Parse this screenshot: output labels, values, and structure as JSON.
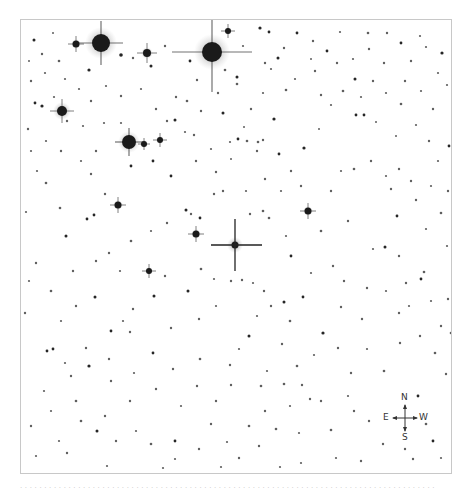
{
  "chart": {
    "kind": "finder-chart",
    "background": "#ffffff",
    "star_color": "#1a1a1a",
    "frame": {
      "x": 20,
      "y": 19,
      "width": 432,
      "height": 455,
      "border": "#c8c8c8"
    }
  },
  "target": {
    "x": 234,
    "y": 244,
    "h_from": 210,
    "h_to": 261,
    "v_from": 218,
    "v_to": 270
  },
  "bright_stars": [
    {
      "x": 100,
      "y": 42,
      "r": 9,
      "spike": 22,
      "halo": 16
    },
    {
      "x": 211,
      "y": 51,
      "r": 10,
      "spike": 40,
      "halo": 18
    },
    {
      "x": 128,
      "y": 141,
      "r": 7,
      "spike": 14,
      "halo": 11
    },
    {
      "x": 61,
      "y": 110,
      "r": 5,
      "spike": 12,
      "halo": 9
    },
    {
      "x": 146,
      "y": 52,
      "r": 4,
      "spike": 10,
      "halo": 6
    },
    {
      "x": 75,
      "y": 43,
      "r": 3.5,
      "spike": 8,
      "halo": 5
    },
    {
      "x": 117,
      "y": 204,
      "r": 3.5,
      "spike": 8,
      "halo": 5
    },
    {
      "x": 195,
      "y": 233,
      "r": 3.5,
      "spike": 8,
      "halo": 5
    },
    {
      "x": 307,
      "y": 210,
      "r": 3.5,
      "spike": 8,
      "halo": 5
    },
    {
      "x": 148,
      "y": 270,
      "r": 3,
      "spike": 7,
      "halo": 4
    },
    {
      "x": 159,
      "y": 139,
      "r": 3,
      "spike": 7,
      "halo": 4
    },
    {
      "x": 227,
      "y": 30,
      "r": 3,
      "spike": 7,
      "halo": 4
    },
    {
      "x": 143,
      "y": 143,
      "r": 3,
      "spike": 6,
      "halo": 4
    }
  ],
  "stars": [
    [
      33,
      39,
      1.5
    ],
    [
      41,
      53,
      1.2
    ],
    [
      58,
      60,
      1.3
    ],
    [
      52,
      32,
      1.0
    ],
    [
      88,
      69,
      1.6
    ],
    [
      120,
      54,
      1.8
    ],
    [
      132,
      57,
      1.2
    ],
    [
      150,
      65,
      1.5
    ],
    [
      164,
      45,
      1.2
    ],
    [
      189,
      60,
      1.4
    ],
    [
      196,
      79,
      1.2
    ],
    [
      224,
      69,
      1.3
    ],
    [
      236,
      76,
      1.5
    ],
    [
      242,
      45,
      1.1
    ],
    [
      259,
      27,
      1.6
    ],
    [
      268,
      31,
      1.4
    ],
    [
      283,
      47,
      1.2
    ],
    [
      296,
      32,
      1.4
    ],
    [
      312,
      40,
      1.2
    ],
    [
      326,
      50,
      1.4
    ],
    [
      339,
      31,
      1.1
    ],
    [
      367,
      32,
      1.3
    ],
    [
      386,
      32,
      1.2
    ],
    [
      400,
      42,
      1.4
    ],
    [
      419,
      35,
      1.1
    ],
    [
      441,
      52,
      1.6
    ],
    [
      437,
      72,
      1.1
    ],
    [
      383,
      62,
      1.2
    ],
    [
      354,
      78,
      1.5
    ],
    [
      310,
      58,
      1.0
    ],
    [
      277,
      57,
      1.5
    ],
    [
      264,
      62,
      1.2
    ],
    [
      270,
      68,
      1.1
    ],
    [
      285,
      89,
      1.3
    ],
    [
      236,
      83,
      1.3
    ],
    [
      222,
      112,
      1.5
    ],
    [
      243,
      126,
      1.0
    ],
    [
      250,
      108,
      1.2
    ],
    [
      262,
      92,
      1.1
    ],
    [
      273,
      118,
      1.6
    ],
    [
      262,
      139,
      1.2
    ],
    [
      257,
      141,
      1.3
    ],
    [
      246,
      140,
      1.3
    ],
    [
      237,
      138,
      1.4
    ],
    [
      229,
      141,
      1.1
    ],
    [
      256,
      150,
      1.2
    ],
    [
      278,
      153,
      1.4
    ],
    [
      303,
      147,
      1.6
    ],
    [
      290,
      170,
      1.2
    ],
    [
      318,
      128,
      1.0
    ],
    [
      355,
      114,
      1.4
    ],
    [
      363,
      114,
      1.4
    ],
    [
      400,
      103,
      1.3
    ],
    [
      415,
      124,
      1.1
    ],
    [
      375,
      121,
      1.0
    ],
    [
      395,
      135,
      1.0
    ],
    [
      428,
      140,
      1.2
    ],
    [
      448,
      145,
      1.4
    ],
    [
      437,
      160,
      1.1
    ],
    [
      398,
      168,
      1.2
    ],
    [
      34,
      102,
      1.4
    ],
    [
      41,
      105,
      1.6
    ],
    [
      53,
      96,
      1.1
    ],
    [
      66,
      120,
      1.2
    ],
    [
      82,
      125,
      1.1
    ],
    [
      27,
      128,
      1.2
    ],
    [
      36,
      170,
      1.1
    ],
    [
      45,
      182,
      1.3
    ],
    [
      25,
      211,
      1.1
    ],
    [
      65,
      235,
      1.5
    ],
    [
      86,
      218,
      1.4
    ],
    [
      59,
      207,
      1.3
    ],
    [
      90,
      173,
      1.2
    ],
    [
      93,
      214,
      1.4
    ],
    [
      104,
      193,
      1.2
    ],
    [
      130,
      165,
      1.4
    ],
    [
      152,
      160,
      1.4
    ],
    [
      166,
      120,
      1.2
    ],
    [
      174,
      119,
      1.5
    ],
    [
      170,
      175,
      1.4
    ],
    [
      175,
      96,
      1.2
    ],
    [
      184,
      131,
      1.1
    ],
    [
      193,
      134,
      1.2
    ],
    [
      217,
      92,
      1.2
    ],
    [
      215,
      171,
      1.2
    ],
    [
      185,
      209,
      1.5
    ],
    [
      190,
      213,
      1.2
    ],
    [
      213,
      193,
      1.2
    ],
    [
      199,
      217,
      1.4
    ],
    [
      230,
      158,
      1.0
    ],
    [
      249,
      213,
      1.2
    ],
    [
      262,
      210,
      1.3
    ],
    [
      268,
      217,
      1.3
    ],
    [
      285,
      235,
      1.1
    ],
    [
      320,
      230,
      1.3
    ],
    [
      290,
      255,
      1.4
    ],
    [
      310,
      272,
      1.1
    ],
    [
      347,
      220,
      1.2
    ],
    [
      353,
      168,
      1.3
    ],
    [
      390,
      188,
      1.2
    ],
    [
      396,
      215,
      1.4
    ],
    [
      415,
      199,
      1.2
    ],
    [
      425,
      228,
      1.1
    ],
    [
      440,
      212,
      1.3
    ],
    [
      372,
      248,
      1.1
    ],
    [
      384,
      246,
      1.5
    ],
    [
      398,
      255,
      1.2
    ],
    [
      423,
      271,
      1.3
    ],
    [
      420,
      278,
      1.4
    ],
    [
      446,
      245,
      1.1
    ],
    [
      332,
      265,
      1.2
    ],
    [
      343,
      280,
      1.2
    ],
    [
      366,
      287,
      1.2
    ],
    [
      385,
      290,
      1.1
    ],
    [
      405,
      282,
      1.2
    ],
    [
      430,
      300,
      1.1
    ],
    [
      447,
      298,
      1.2
    ],
    [
      263,
      290,
      1.2
    ],
    [
      252,
      282,
      1.1
    ],
    [
      241,
      279,
      1.2
    ],
    [
      230,
      280,
      1.2
    ],
    [
      213,
      278,
      1.1
    ],
    [
      200,
      268,
      1.3
    ],
    [
      187,
      290,
      1.5
    ],
    [
      164,
      275,
      1.2
    ],
    [
      153,
      295,
      1.5
    ],
    [
      132,
      308,
      1.2
    ],
    [
      122,
      320,
      1.1
    ],
    [
      110,
      330,
      1.4
    ],
    [
      94,
      296,
      1.5
    ],
    [
      75,
      305,
      1.2
    ],
    [
      50,
      290,
      1.3
    ],
    [
      24,
      312,
      1.2
    ],
    [
      46,
      350,
      1.4
    ],
    [
      52,
      348,
      1.4
    ],
    [
      64,
      362,
      1.1
    ],
    [
      85,
      347,
      1.2
    ],
    [
      88,
      365,
      1.6
    ],
    [
      70,
      375,
      1.2
    ],
    [
      43,
      390,
      1.1
    ],
    [
      75,
      400,
      1.3
    ],
    [
      80,
      420,
      1.3
    ],
    [
      96,
      430,
      1.5
    ],
    [
      104,
      415,
      1.2
    ],
    [
      115,
      440,
      1.2
    ],
    [
      58,
      440,
      1.1
    ],
    [
      30,
      425,
      1.2
    ],
    [
      35,
      455,
      1.1
    ],
    [
      66,
      452,
      1.2
    ],
    [
      106,
      465,
      1.1
    ],
    [
      129,
      400,
      1.2
    ],
    [
      135,
      430,
      1.1
    ],
    [
      150,
      443,
      1.3
    ],
    [
      174,
      440,
      1.4
    ],
    [
      174,
      458,
      1.1
    ],
    [
      198,
      448,
      1.2
    ],
    [
      210,
      423,
      1.2
    ],
    [
      226,
      441,
      1.1
    ],
    [
      238,
      457,
      1.2
    ],
    [
      258,
      445,
      1.2
    ],
    [
      248,
      425,
      1.3
    ],
    [
      260,
      385,
      1.3
    ],
    [
      264,
      410,
      1.2
    ],
    [
      275,
      428,
      1.3
    ],
    [
      289,
      405,
      1.1
    ],
    [
      298,
      432,
      1.1
    ],
    [
      309,
      398,
      1.2
    ],
    [
      320,
      400,
      1.2
    ],
    [
      330,
      429,
      1.3
    ],
    [
      335,
      457,
      1.1
    ],
    [
      382,
      443,
      1.2
    ],
    [
      432,
      440,
      1.4
    ],
    [
      425,
      423,
      1.3
    ],
    [
      440,
      457,
      1.1
    ],
    [
      412,
      458,
      1.2
    ],
    [
      360,
      460,
      1.2
    ],
    [
      300,
      462,
      1.1
    ],
    [
      279,
      466,
      1.1
    ],
    [
      220,
      466,
      1.1
    ],
    [
      162,
      467,
      1.1
    ],
    [
      108,
      358,
      1.2
    ],
    [
      129,
      331,
      1.2
    ],
    [
      152,
      352,
      1.4
    ],
    [
      172,
      368,
      1.2
    ],
    [
      199,
      358,
      1.3
    ],
    [
      229,
      364,
      1.2
    ],
    [
      230,
      384,
      1.2
    ],
    [
      238,
      348,
      1.1
    ],
    [
      248,
      335,
      1.5
    ],
    [
      266,
      370,
      1.1
    ],
    [
      281,
      343,
      1.2
    ],
    [
      296,
      365,
      1.3
    ],
    [
      313,
      354,
      1.1
    ],
    [
      322,
      332,
      1.6
    ],
    [
      337,
      347,
      1.2
    ],
    [
      350,
      372,
      1.2
    ],
    [
      366,
      348,
      1.1
    ],
    [
      383,
      370,
      1.3
    ],
    [
      399,
      342,
      1.2
    ],
    [
      419,
      335,
      1.2
    ],
    [
      434,
      352,
      1.3
    ],
    [
      445,
      373,
      1.2
    ],
    [
      417,
      395,
      1.4
    ],
    [
      404,
      448,
      1.2
    ],
    [
      368,
      420,
      1.2
    ],
    [
      353,
      410,
      1.2
    ],
    [
      347,
      395,
      1.1
    ],
    [
      301,
      384,
      1.2
    ],
    [
      283,
      383,
      1.3
    ],
    [
      289,
      320,
      1.3
    ],
    [
      256,
      315,
      1.1
    ],
    [
      270,
      305,
      1.2
    ],
    [
      283,
      301,
      1.5
    ],
    [
      302,
      296,
      1.4
    ],
    [
      340,
      306,
      1.2
    ],
    [
      361,
      318,
      1.2
    ],
    [
      398,
      312,
      1.2
    ],
    [
      408,
      305,
      1.1
    ],
    [
      440,
      325,
      1.2
    ],
    [
      450,
      332,
      1.3
    ],
    [
      95,
      260,
      1.2
    ],
    [
      108,
      252,
      1.2
    ],
    [
      130,
      240,
      1.3
    ],
    [
      150,
      230,
      1.1
    ],
    [
      166,
      222,
      1.2
    ],
    [
      119,
      270,
      1.1
    ],
    [
      35,
      262,
      1.2
    ],
    [
      28,
      280,
      1.1
    ],
    [
      72,
      270,
      1.2
    ],
    [
      60,
      320,
      1.1
    ],
    [
      110,
      380,
      1.2
    ],
    [
      50,
      410,
      1.1
    ],
    [
      155,
      388,
      1.2
    ],
    [
      180,
      405,
      1.1
    ],
    [
      196,
      385,
      1.2
    ],
    [
      215,
      400,
      1.2
    ],
    [
      133,
      372,
      1.1
    ],
    [
      170,
      327,
      1.2
    ],
    [
      198,
      318,
      1.2
    ],
    [
      215,
      305,
      1.1
    ],
    [
      320,
      94,
      1.2
    ],
    [
      330,
      104,
      1.1
    ],
    [
      342,
      90,
      1.3
    ],
    [
      360,
      96,
      1.1
    ],
    [
      372,
      80,
      1.2
    ],
    [
      385,
      92,
      1.1
    ],
    [
      404,
      80,
      1.2
    ],
    [
      420,
      90,
      1.1
    ],
    [
      432,
      108,
      1.2
    ],
    [
      446,
      84,
      1.1
    ],
    [
      336,
      62,
      1.2
    ],
    [
      352,
      58,
      1.1
    ],
    [
      368,
      48,
      1.2
    ],
    [
      410,
      60,
      1.2
    ],
    [
      425,
      46,
      1.1
    ],
    [
      294,
      78,
      1.1
    ],
    [
      314,
      70,
      1.2
    ],
    [
      186,
      100,
      1.3
    ],
    [
      200,
      110,
      1.2
    ],
    [
      155,
      108,
      1.2
    ],
    [
      140,
      88,
      1.1
    ],
    [
      120,
      95,
      1.2
    ],
    [
      105,
      85,
      1.1
    ],
    [
      90,
      100,
      1.2
    ],
    [
      78,
      88,
      1.1
    ],
    [
      30,
      80,
      1.2
    ],
    [
      44,
      72,
      1.1
    ],
    [
      28,
      60,
      1.0
    ],
    [
      64,
      78,
      1.1
    ],
    [
      103,
      122,
      1.1
    ],
    [
      120,
      122,
      1.1
    ],
    [
      95,
      150,
      1.2
    ],
    [
      80,
      160,
      1.1
    ],
    [
      60,
      150,
      1.2
    ],
    [
      45,
      140,
      1.1
    ],
    [
      30,
      150,
      1.1
    ],
    [
      195,
      160,
      1.2
    ],
    [
      210,
      148,
      1.1
    ],
    [
      222,
      190,
      1.2
    ],
    [
      245,
      190,
      1.1
    ],
    [
      264,
      178,
      1.2
    ],
    [
      280,
      190,
      1.1
    ],
    [
      300,
      185,
      1.2
    ],
    [
      330,
      190,
      1.2
    ],
    [
      340,
      170,
      1.1
    ],
    [
      370,
      160,
      1.2
    ],
    [
      385,
      175,
      1.1
    ],
    [
      410,
      180,
      1.2
    ],
    [
      430,
      185,
      1.1
    ],
    [
      447,
      190,
      1.2
    ]
  ],
  "compass": {
    "north_label": "N",
    "south_label": "S",
    "east_label": "E",
    "west_label": "W"
  },
  "caption": {
    "text": "· · · · · · · · · · · · · · · · · · · · · · · · · · · · · · · · · · · · · · · · · · · · · · · · · · · · · · · · · · · · · · · · · · · · · · · · · · · · · · · · · · · · · ·"
  }
}
